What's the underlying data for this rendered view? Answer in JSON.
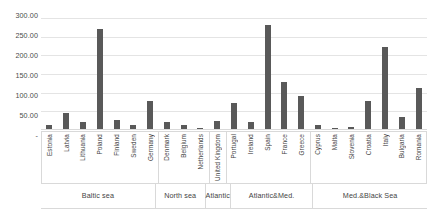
{
  "chart_data": {
    "type": "bar",
    "title": "",
    "xlabel": "",
    "ylabel": "",
    "ylim": [
      0,
      300
    ],
    "grid": true,
    "legend": "none",
    "y_tick_labels": [
      "300.00",
      "250.00",
      "200.00",
      "150.00",
      "100.00",
      "50.00",
      "-"
    ],
    "y_tick_values": [
      300,
      250,
      200,
      150,
      100,
      50,
      0
    ],
    "categories": [
      "Estonia",
      "Latvia",
      "Lithuania",
      "Poland",
      "Finland",
      "Sweden",
      "Germany",
      "Denmark",
      "Belgium",
      "Netherlands",
      "United Kingdom",
      "Portugal",
      "Ireland",
      "Spain",
      "France",
      "Greece",
      "Cyprus",
      "Malta",
      "Slovenia",
      "Croatia",
      "Italy",
      "Bulgaria",
      "Romania"
    ],
    "values": [
      12,
      44,
      19,
      268,
      24,
      11,
      76,
      18,
      10,
      3,
      22,
      71,
      19,
      278,
      126,
      89,
      12,
      2,
      6,
      74,
      220,
      32,
      110
    ],
    "groups": [
      {
        "label": "Baltic sea",
        "count": 7
      },
      {
        "label": "North sea",
        "count": 3
      },
      {
        "label": "Atlantic",
        "count": 1
      },
      {
        "label": "Atlantic&Med.",
        "count": 5
      },
      {
        "label": "Med.&Black Sea",
        "count": 7
      }
    ],
    "colors": {
      "bar": "#595959",
      "gridline": "#e4e4e4",
      "axis": "#d9d9d9",
      "text": "#444444",
      "background": "#ffffff"
    }
  }
}
